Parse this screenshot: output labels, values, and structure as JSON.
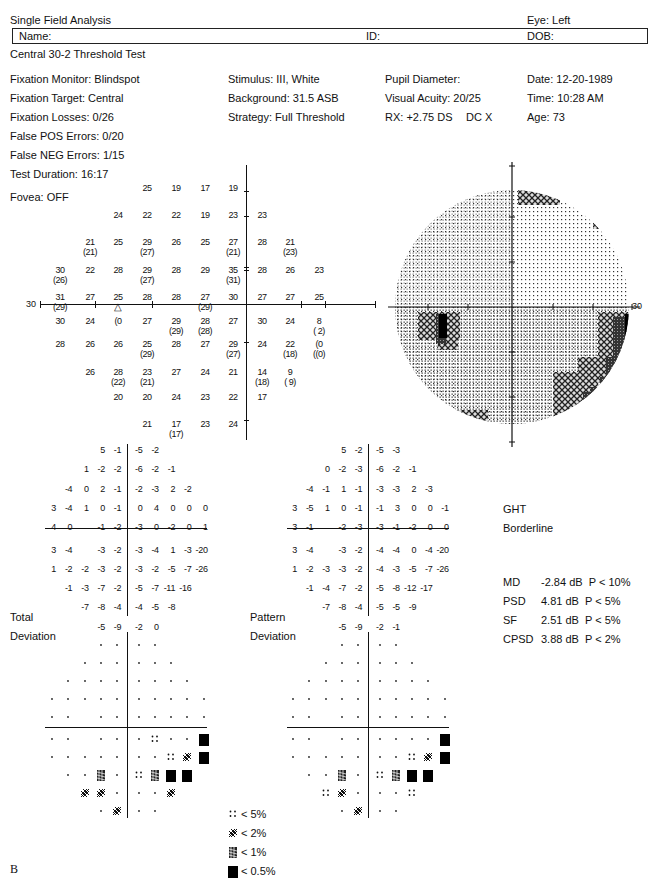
{
  "header": {
    "title": "Single Field Analysis",
    "eye": "Eye: Left",
    "name_label": "Name:",
    "id_label": "ID:",
    "dob_label": "DOB:",
    "test_name": "Central 30-2 Threshold Test"
  },
  "info": {
    "col1": [
      "Fixation Monitor: Blindspot",
      "Fixation Target: Central",
      "Fixation Losses: 0/26",
      "False POS Errors: 0/20",
      "False NEG Errors: 1/15",
      "Test Duration: 16:17"
    ],
    "fovea": "Fovea: OFF",
    "col2": [
      "Stimulus: III, White",
      "Background: 31.5 ASB",
      "Strategy: Full Threshold"
    ],
    "col3": [
      "Pupil Diameter:",
      "Visual Acuity: 20/25",
      "RX: +2.75 DS",
      "DC X"
    ],
    "col4": [
      "Date: 12-20-1989",
      "Time: 10:28 AM",
      "Age: 73"
    ]
  },
  "threshold": {
    "axis_label": "30",
    "rows": [
      [
        null,
        null,
        null,
        "25",
        "19",
        "17",
        "19",
        null,
        null,
        null
      ],
      [
        null,
        null,
        "24",
        "22",
        "22",
        "19",
        "23",
        "23",
        null,
        null
      ],
      [
        null,
        "21\n(21)",
        "25",
        "29\n(27)",
        "26",
        "25",
        "27\n(21)",
        "28",
        "21\n(23)",
        null
      ],
      [
        "30\n(26)",
        "22",
        "28",
        "29\n(27)",
        "28",
        "29",
        "35\n(31)",
        "28",
        "26",
        "23"
      ],
      [
        "31\n(29)",
        "27",
        "25\n△",
        "28",
        "28",
        "27\n(29)",
        "30",
        "27",
        "27",
        "25"
      ],
      [
        "30",
        "24",
        "(0",
        "27",
        "29\n(29)",
        "28\n(28)",
        "27",
        "30",
        "24",
        "8\n( 2)"
      ],
      [
        "28",
        "26",
        "26",
        "25\n(29)",
        "28",
        "27",
        "29\n(27)",
        "24",
        "22\n(18)",
        "(0\n((0)"
      ],
      [
        null,
        "26",
        "28\n(22)",
        "23\n(21)",
        "27",
        "24",
        "21",
        "14\n(18)",
        "9\n( 9)",
        null
      ],
      [
        null,
        null,
        "20",
        "20",
        "24",
        "23",
        "22",
        "17",
        null,
        null
      ],
      [
        null,
        null,
        null,
        "21",
        "17\n(17)",
        "23",
        "24",
        null,
        null,
        null
      ]
    ]
  },
  "grayscale": {
    "axis_label": "30"
  },
  "total_deviation": {
    "label_line1": "Total",
    "label_line2": "Deviation",
    "rows": [
      [
        null,
        null,
        null,
        "5",
        "-1",
        "-5",
        "-2",
        null,
        null,
        null
      ],
      [
        null,
        null,
        "1",
        "-2",
        "-2",
        "-6",
        "-2",
        "-1",
        null,
        null
      ],
      [
        null,
        "-4",
        "0",
        "2",
        "-1",
        "-2",
        "-3",
        "2",
        "-2",
        null
      ],
      [
        "3",
        "-4",
        "1",
        "0",
        "-1",
        "0",
        "4",
        "0",
        "0",
        "0"
      ],
      [
        "4",
        "0",
        null,
        "-1",
        "-2",
        "-3",
        "0",
        "-2",
        "0",
        "1"
      ],
      [
        "3",
        "-4",
        null,
        "-3",
        "-2",
        "-3",
        "-4",
        "1",
        "-3",
        "-20"
      ],
      [
        "1",
        "-2",
        "-2",
        "-3",
        "-2",
        "-3",
        "-2",
        "-5",
        "-7",
        "-26"
      ],
      [
        null,
        "-1",
        "-3",
        "-7",
        "-2",
        "-5",
        "-7",
        "-11",
        "-16",
        null
      ],
      [
        null,
        null,
        "-7",
        "-8",
        "-4",
        "-4",
        "-5",
        "-8",
        null,
        null
      ],
      [
        null,
        null,
        null,
        "-5",
        "-9",
        "-2",
        "0",
        null,
        null,
        null
      ]
    ],
    "prob_rows": [
      [
        null,
        null,
        null,
        ".",
        ".",
        ".",
        ".",
        null,
        null,
        null
      ],
      [
        null,
        null,
        ".",
        ".",
        ".",
        ".",
        ".",
        ".",
        null,
        null
      ],
      [
        null,
        ".",
        ".",
        ".",
        ".",
        ".",
        ".",
        ".",
        ".",
        null
      ],
      [
        ".",
        ".",
        ".",
        ".",
        ".",
        ".",
        ".",
        ".",
        ".",
        "."
      ],
      [
        ".",
        ".",
        null,
        ".",
        ".",
        ".",
        ".",
        ".",
        ".",
        "."
      ],
      [
        ".",
        ".",
        null,
        ".",
        ".",
        ".",
        "p5",
        ".",
        ".",
        "p05"
      ],
      [
        ".",
        ".",
        ".",
        ".",
        ".",
        ".",
        ".",
        "p5",
        "p2",
        "p05"
      ],
      [
        null,
        ".",
        ".",
        "p1",
        ".",
        "p5",
        "p1",
        "p05",
        "p05",
        null
      ],
      [
        null,
        null,
        "p2",
        "p2",
        ".",
        ".",
        ".",
        "p2",
        null,
        null
      ],
      [
        null,
        null,
        null,
        ".",
        "p2",
        ".",
        ".",
        null,
        null,
        null
      ]
    ]
  },
  "pattern_deviation": {
    "label_line1": "Pattern",
    "label_line2": "Deviation",
    "rows": [
      [
        null,
        null,
        null,
        "5",
        "-2",
        "-5",
        "-3",
        null,
        null,
        null
      ],
      [
        null,
        null,
        "0",
        "-2",
        "-3",
        "-6",
        "-2",
        "-1",
        null,
        null
      ],
      [
        null,
        "-4",
        "-1",
        "1",
        "-1",
        "-3",
        "-3",
        "2",
        "-3",
        null
      ],
      [
        "3",
        "-5",
        "1",
        "0",
        "-1",
        "-1",
        "3",
        "0",
        "0",
        "-1"
      ],
      [
        "3",
        "-1",
        null,
        "-2",
        "-3",
        "-3",
        "-1",
        "-2",
        "0",
        "0"
      ],
      [
        "3",
        "-4",
        null,
        "-3",
        "-2",
        "-4",
        "-4",
        "0",
        "-4",
        "-20"
      ],
      [
        "1",
        "-2",
        "-3",
        "-3",
        "-2",
        "-4",
        "-3",
        "-5",
        "-7",
        "-26"
      ],
      [
        null,
        "-1",
        "-4",
        "-7",
        "-2",
        "-5",
        "-8",
        "-12",
        "-17",
        null
      ],
      [
        null,
        null,
        "-7",
        "-8",
        "-4",
        "-5",
        "-5",
        "-9",
        null,
        null
      ],
      [
        null,
        null,
        null,
        "-5",
        "-9",
        "-2",
        "-1",
        null,
        null,
        null
      ]
    ],
    "prob_rows": [
      [
        null,
        null,
        null,
        ".",
        ".",
        ".",
        ".",
        null,
        null,
        null
      ],
      [
        null,
        null,
        ".",
        ".",
        ".",
        ".",
        ".",
        ".",
        null,
        null
      ],
      [
        null,
        ".",
        ".",
        ".",
        ".",
        ".",
        ".",
        ".",
        ".",
        null
      ],
      [
        ".",
        ".",
        ".",
        ".",
        ".",
        ".",
        ".",
        ".",
        ".",
        "."
      ],
      [
        ".",
        ".",
        null,
        ".",
        ".",
        ".",
        ".",
        ".",
        ".",
        "."
      ],
      [
        ".",
        ".",
        null,
        ".",
        ".",
        ".",
        ".",
        ".",
        ".",
        "p05"
      ],
      [
        ".",
        ".",
        ".",
        ".",
        ".",
        ".",
        ".",
        "p5",
        "p2",
        "p05"
      ],
      [
        null,
        ".",
        ".",
        "p1",
        ".",
        "p5",
        "p1",
        "p05",
        "p05",
        null
      ],
      [
        null,
        null,
        "p5",
        "p2",
        ".",
        ".",
        ".",
        "p5",
        null,
        null
      ],
      [
        null,
        null,
        null,
        ".",
        "p2",
        ".",
        ".",
        null,
        null,
        null
      ]
    ]
  },
  "ght": {
    "label": "GHT",
    "value": "Borderline"
  },
  "stats": [
    {
      "key": "MD",
      "value": "-2.84 dB",
      "p": "P < 10%"
    },
    {
      "key": "PSD",
      "value": "4.81 dB",
      "p": "P < 5%"
    },
    {
      "key": "SF",
      "value": "2.51 dB",
      "p": "P < 5%"
    },
    {
      "key": "CPSD",
      "value": "3.88 dB",
      "p": "P < 2%"
    }
  ],
  "legend": [
    {
      "symbol": "p5",
      "label": "< 5%"
    },
    {
      "symbol": "p2",
      "label": "< 2%"
    },
    {
      "symbol": "p1",
      "label": "< 1%"
    },
    {
      "symbol": "p05",
      "label": "< 0.5%"
    }
  ],
  "corner_label": "B"
}
